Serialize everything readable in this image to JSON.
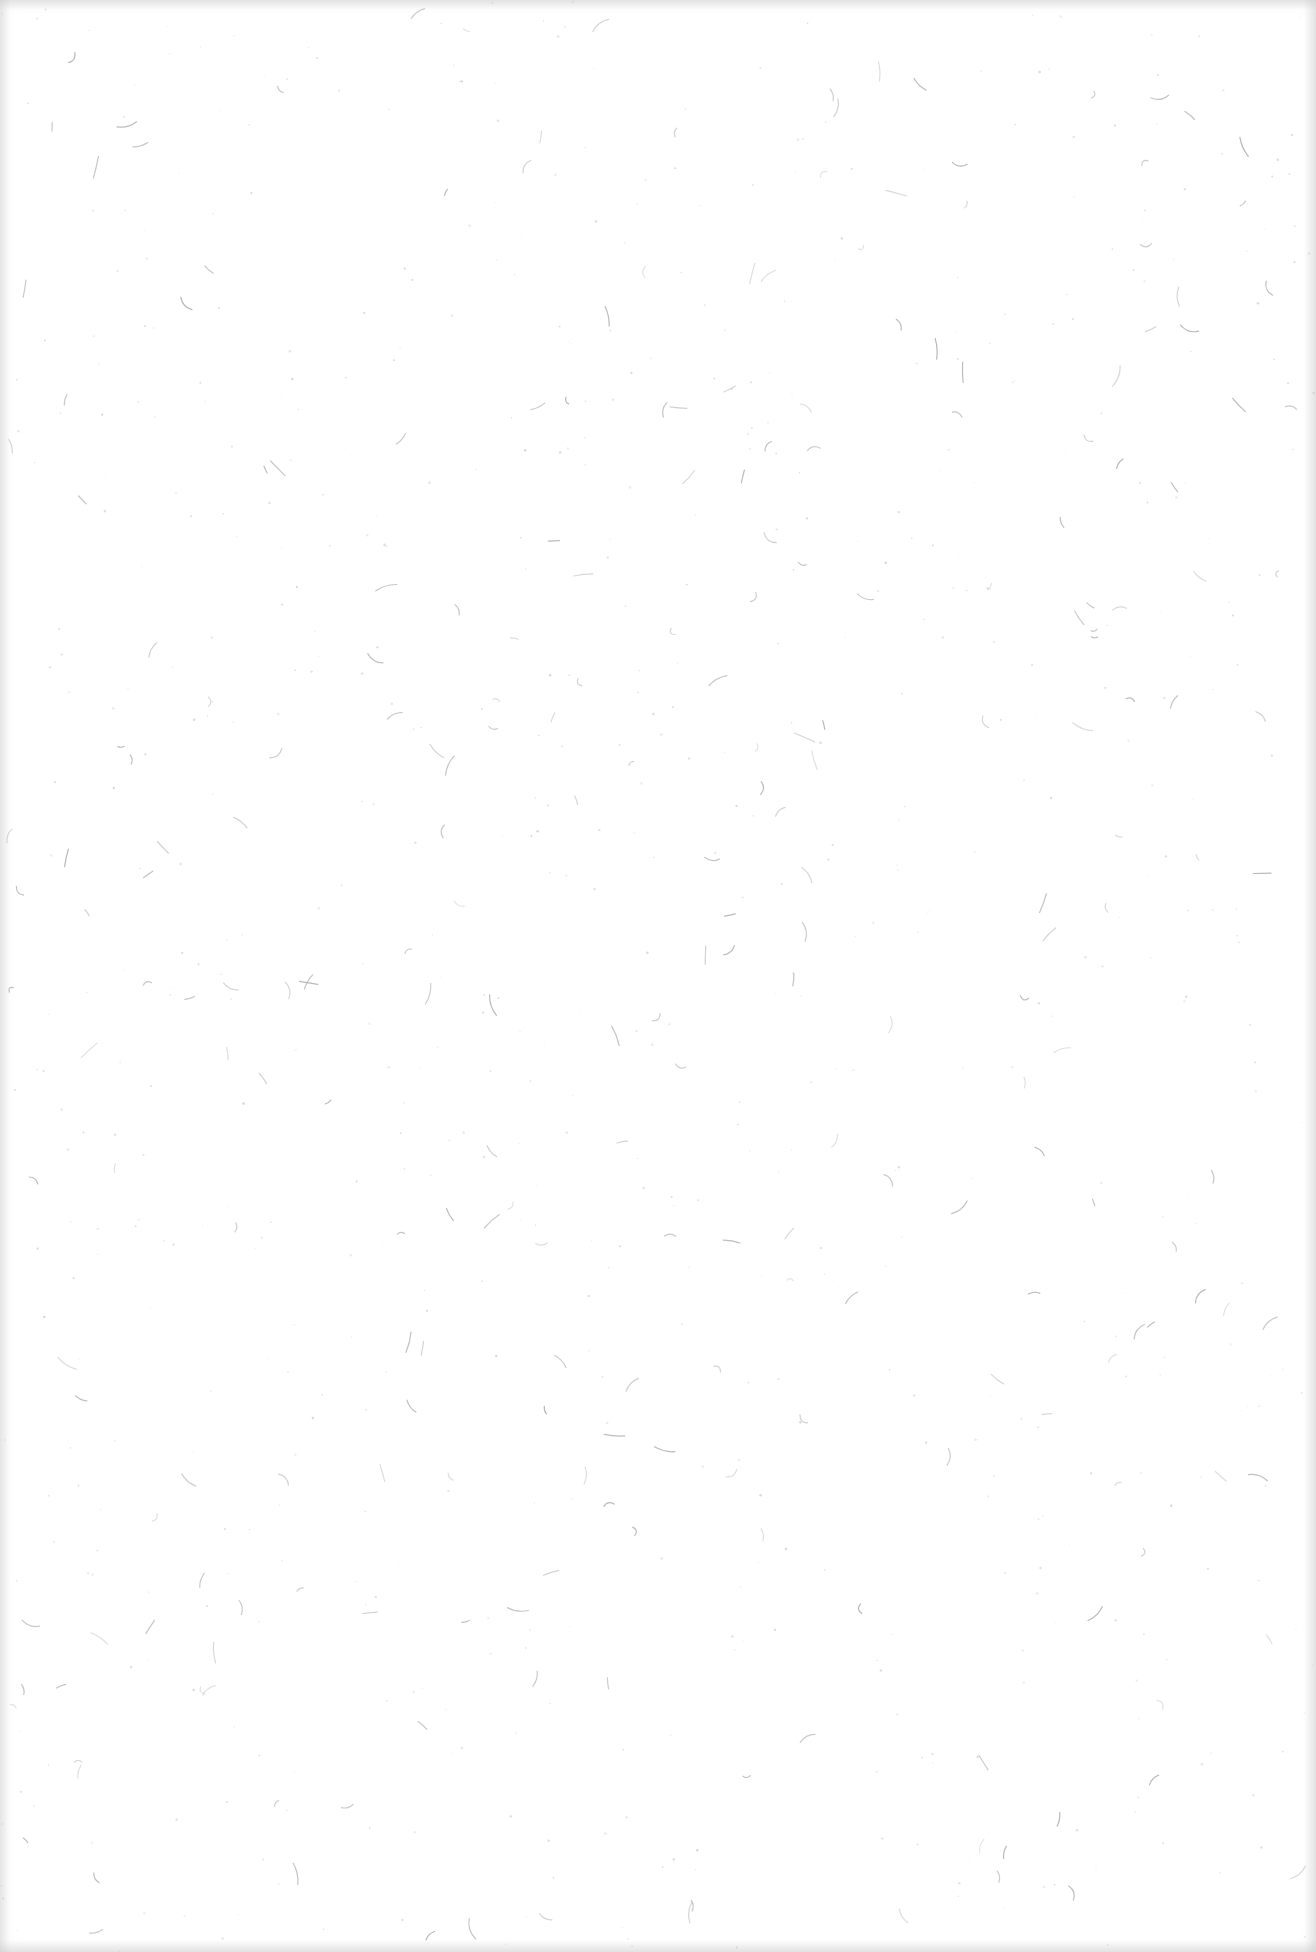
{
  "page": {
    "background_color": "#ffffff",
    "fiber_color": "#9a9a9a",
    "speck_color": "#b5b5b5",
    "edge_shadow_color": "#c8c8c8"
  }
}
